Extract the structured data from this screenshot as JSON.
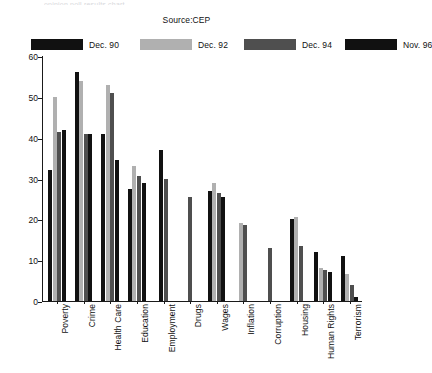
{
  "header": {
    "cut_off_text": "opinion poll results chart",
    "source": "Source:CEP"
  },
  "chart_data": {
    "type": "bar",
    "title": "Source:CEP",
    "xlabel": "",
    "ylabel": "",
    "ylim": [
      0,
      60
    ],
    "yticks": [
      0,
      10,
      20,
      30,
      40,
      50,
      60
    ],
    "grid": false,
    "legend_position": "top",
    "categories": [
      "Poverty",
      "Crime",
      "Health Care",
      "Education",
      "Employment",
      "Drugs",
      "Wages",
      "Inflation",
      "Corruption",
      "Housing",
      "Human Rights",
      "Terrorism"
    ],
    "series": [
      {
        "name": "Dec. 90",
        "color": "#111111",
        "values": [
          32,
          56,
          41,
          27.5,
          37,
          null,
          27,
          null,
          null,
          20,
          12,
          11
        ]
      },
      {
        "name": "Dec. 92",
        "color": "#b0b0b0",
        "values": [
          50,
          54,
          53,
          33,
          null,
          null,
          29,
          19,
          null,
          20.5,
          8,
          6.5
        ]
      },
      {
        "name": "Dec. 94",
        "color": "#4f4f4f",
        "values": [
          41.5,
          41,
          51,
          30.5,
          30,
          25.5,
          26.5,
          18.5,
          13,
          13.5,
          7.5,
          4
        ]
      },
      {
        "name": "Nov. 96",
        "color": "#111111",
        "values": [
          42,
          41,
          34.5,
          29,
          null,
          null,
          25.5,
          null,
          null,
          null,
          7,
          1
        ]
      }
    ]
  }
}
